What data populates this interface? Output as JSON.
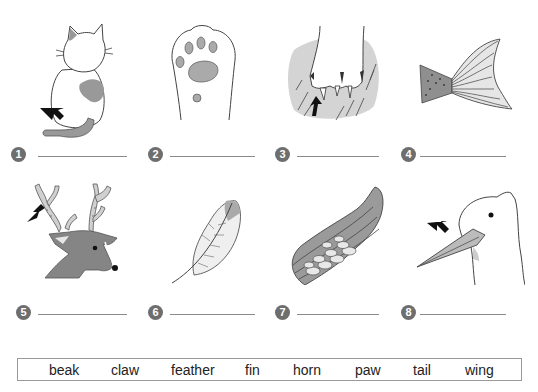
{
  "exercise": {
    "items": [
      {
        "number": "1",
        "picture": "cat-tail",
        "answer": ""
      },
      {
        "number": "2",
        "picture": "cat-paw",
        "answer": ""
      },
      {
        "number": "3",
        "picture": "claw-scratch",
        "answer": ""
      },
      {
        "number": "4",
        "picture": "fish-fin",
        "answer": ""
      },
      {
        "number": "5",
        "picture": "deer-horn",
        "answer": ""
      },
      {
        "number": "6",
        "picture": "feather",
        "answer": ""
      },
      {
        "number": "7",
        "picture": "wing",
        "answer": ""
      },
      {
        "number": "8",
        "picture": "bird-beak",
        "answer": ""
      }
    ]
  },
  "word_bank": {
    "words": [
      "beak",
      "claw",
      "feather",
      "fin",
      "horn",
      "paw",
      "tail",
      "wing"
    ]
  },
  "colors": {
    "badge": "#6e6e6e",
    "fill_gray": "#9a9a9a",
    "fill_light": "#d6d6d6",
    "line": "#444444",
    "arrow": "#111111"
  }
}
